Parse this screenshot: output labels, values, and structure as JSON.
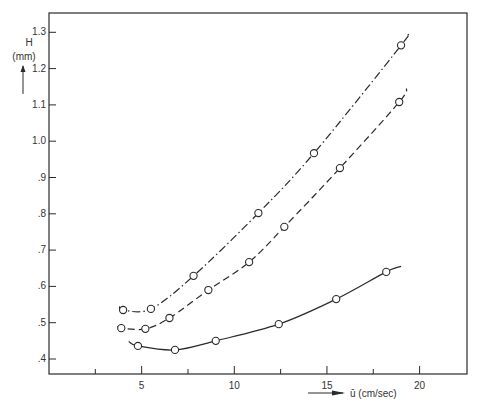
{
  "chart_data": {
    "type": "line",
    "title": "",
    "xlabel": "ū (cm/sec)",
    "ylabel": "H (mm)",
    "ylabel_line1": "H",
    "ylabel_line2": "(mm)",
    "xlim": [
      0,
      22.5
    ],
    "ylim": [
      0.35,
      1.35
    ],
    "grid": false,
    "legend": null,
    "x_ticks": [
      2.5,
      5,
      7.5,
      10,
      12.5,
      15,
      17.5,
      20
    ],
    "x_tick_labels": [
      {
        "value": 5,
        "label": "5"
      },
      {
        "value": 10,
        "label": "10"
      },
      {
        "value": 15,
        "label": "15"
      },
      {
        "value": 20,
        "label": "20"
      }
    ],
    "y_ticks": [
      {
        "value": 0.4,
        "label": ".4"
      },
      {
        "value": 0.5,
        "label": ".5"
      },
      {
        "value": 0.6,
        "label": ".6"
      },
      {
        "value": 0.7,
        "label": ".7"
      },
      {
        "value": 0.8,
        "label": ".8"
      },
      {
        "value": 0.9,
        "label": ".9"
      },
      {
        "value": 1.0,
        "label": "1.0"
      },
      {
        "value": 1.1,
        "label": "1.1"
      },
      {
        "value": 1.2,
        "label": "1.2"
      },
      {
        "value": 1.3,
        "label": "1.3"
      }
    ],
    "series": [
      {
        "name": "dash-dot curve",
        "line_style": "dash-dot",
        "marker": "open-circle",
        "curve_start": [
          3.8,
          0.545
        ],
        "curve_end": [
          19.3,
          1.29
        ],
        "x": [
          4.0,
          5.5,
          7.8,
          11.3,
          14.3,
          19.0
        ],
        "y": [
          0.535,
          0.538,
          0.629,
          0.802,
          0.967,
          1.264
        ]
      },
      {
        "name": "dashed curve",
        "line_style": "dashed",
        "marker": "open-circle",
        "curve_start": [
          3.7,
          0.49
        ],
        "curve_end": [
          19.3,
          1.145
        ],
        "x": [
          3.9,
          5.2,
          6.5,
          8.6,
          10.8,
          12.7,
          15.7,
          18.9
        ],
        "y": [
          0.485,
          0.483,
          0.513,
          0.59,
          0.667,
          0.764,
          0.926,
          1.108
        ]
      },
      {
        "name": "solid curve",
        "line_style": "solid",
        "marker": "open-circle",
        "curve_start": [
          4.3,
          0.448
        ],
        "curve_end": [
          19.0,
          0.655
        ],
        "x": [
          4.8,
          6.8,
          9.0,
          12.4,
          15.5,
          18.2
        ],
        "y": [
          0.436,
          0.425,
          0.45,
          0.496,
          0.565,
          0.64
        ]
      }
    ]
  },
  "layout": {
    "plot_left": 49,
    "plot_top": 13,
    "plot_right": 467,
    "plot_bottom": 374,
    "x_px_per_unit": 18.53,
    "y_px_at_0_4": 359,
    "y_px_per_unit": 363
  },
  "colors": {
    "ink": "#2a2a2a",
    "background": "#ffffff"
  }
}
